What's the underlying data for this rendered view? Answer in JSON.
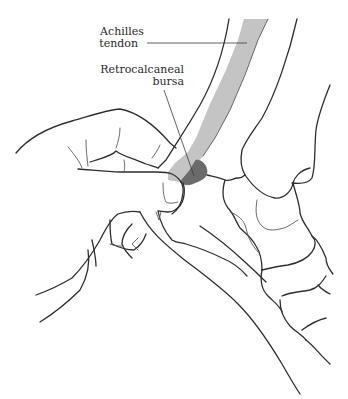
{
  "figure": {
    "labels": [
      {
        "id": "achilles-tendon",
        "line1": "Achilles",
        "line2": "tendon"
      },
      {
        "id": "retrocalcaneal-bursa",
        "line1": "Retrocalcaneal",
        "line2": "bursa"
      }
    ],
    "colors": {
      "line": "#2e2e2e",
      "tendon_fill": "#c4c4c4",
      "bursa_fill": "#6b6b6b",
      "background": "#ffffff"
    }
  }
}
